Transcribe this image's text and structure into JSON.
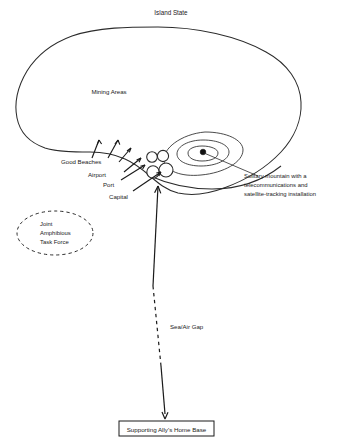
{
  "diagram": {
    "title": "Island State",
    "background_color": "#ffffff",
    "ink_color": "#1a1a1a",
    "labels": {
      "island_state": "Island State",
      "mining_areas": "Mining Areas",
      "good_beaches": "Good Beaches",
      "airport": "Airport",
      "port": "Port",
      "capital": "Capital",
      "sea_air_gap": "Sea/Air Gap"
    },
    "mountain_note": {
      "line1": "Solitary mountain with a",
      "line2": "telecommunications and",
      "line3": "satellite-tracking installation"
    },
    "task_force": {
      "line1": "Joint",
      "line2": "Amphibious",
      "line3": "Task Force"
    },
    "home_base": {
      "label": "Supporting Ally's Home Base"
    },
    "icons": {
      "coastline": "island-coastline-outline",
      "contours": "mountain-contour-rings",
      "peak": "mountain-peak-dot",
      "settlements": "settlement-circles",
      "beach_arrows": "beach-pointer-arrows",
      "gap_arrow": "sea-air-gap-double-arrow",
      "task_force_ring": "dashed-ellipse-marker"
    }
  }
}
